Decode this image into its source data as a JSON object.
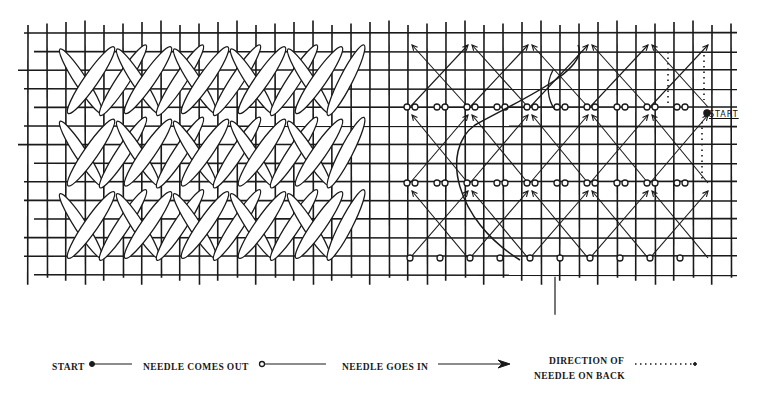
{
  "figure": {
    "title": "",
    "left_panel": "worked stitch sample",
    "right_panel": "needle path diagram",
    "grid": {
      "columns": 37,
      "rows": 13
    },
    "ink_color": "#1a1a1a",
    "paper_color": "#ffffff",
    "stitch_fill": "#ffffff",
    "start_marker_label": "START"
  },
  "legend": {
    "items": [
      {
        "label": "START",
        "symbol": "filled-dot-line"
      },
      {
        "label": "NEEDLE COMES OUT",
        "symbol": "open-circle-line"
      },
      {
        "label": "NEEDLE GOES IN",
        "symbol": "arrow-line"
      },
      {
        "label_line1": "DIRECTION OF",
        "label_line2": "NEEDLE ON BACK",
        "symbol": "dotted-line"
      }
    ]
  }
}
